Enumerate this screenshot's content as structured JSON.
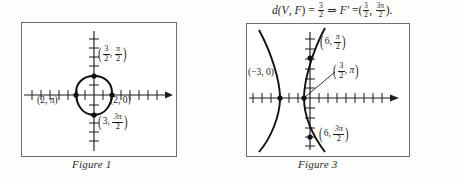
{
  "page": {
    "background_color": "#ffffff",
    "ink_color": "#1c1c1c",
    "frame_color": "#6e6e6e"
  },
  "equation": {
    "d_function": "d(",
    "d_args_v": "V",
    "d_args_sep": ", ",
    "d_args_f": "F",
    "d_close": ")",
    "equals": "=",
    "distance_num": "3",
    "distance_den": "2",
    "implies": "⇒",
    "focus_symbol": "F′",
    "equals2": "=",
    "open_paren": "(",
    "r_num": "3",
    "r_den": "2",
    "comma": ",",
    "theta_num": "3π",
    "theta_den": "2",
    "close_paren": ")",
    "period": ".",
    "plain_text": "d(V, F) = 3/2 ⇒ F′ = (3/2, 3π/2)."
  },
  "figure1": {
    "caption": "Figure 1",
    "curve_type": "limacon-circle",
    "labels": {
      "top": {
        "open": "(",
        "r": "3",
        "r_den": "2",
        "comma": ",",
        "theta": "π",
        "theta_den": "2",
        "close": ")",
        "plain": "(3/2, π/2)"
      },
      "left": {
        "plain": "(2, π)",
        "r": "2",
        "comma": ", ",
        "theta": "π"
      },
      "right": {
        "plain": "(2, 0)",
        "r": "2",
        "comma": ", ",
        "theta": "0"
      },
      "bottom": {
        "open": "(",
        "r": "3",
        "comma": ",",
        "theta": "3π",
        "theta_den": "2",
        "close": ")",
        "plain": "(3, 3π/2)"
      }
    }
  },
  "figure3": {
    "caption": "Figure 3",
    "curve_type": "hyperbola",
    "labels": {
      "top": {
        "open": "(",
        "r": "6",
        "comma": ",",
        "theta": "π",
        "theta_den": "2",
        "close": ")",
        "plain": "(6, π/2)"
      },
      "middle": {
        "open": "(",
        "r": "3",
        "r_den": "2",
        "comma": ",",
        "theta": "π",
        "close": ")",
        "plain": "(3/2, π)"
      },
      "left": {
        "plain": "(−3, 0)"
      },
      "bottom": {
        "open": "(",
        "r": "6",
        "comma": ",",
        "theta": "3π",
        "theta_den": "2",
        "close": ")",
        "plain": "(6, 3π/2)"
      }
    }
  }
}
